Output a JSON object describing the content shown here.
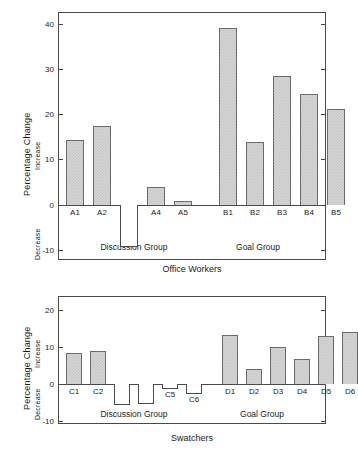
{
  "chart_data": [
    {
      "type": "bar",
      "title": "",
      "panel_label": "Office Workers",
      "xlabel": "Office Workers",
      "ylabel": "Percentage Change",
      "ylabel_upper": "Increase",
      "ylabel_lower": "Decrease",
      "ylim": [
        -10,
        43
      ],
      "yticks": [
        -10,
        0,
        10,
        20,
        30,
        40
      ],
      "ytick_labels": [
        "-10",
        "0",
        "10",
        "20",
        "30",
        "40"
      ],
      "grid": false,
      "legend": "none",
      "groups": [
        {
          "name": "Discussion Group",
          "categories": [
            "A1",
            "A2",
            "A3",
            "A4",
            "A5"
          ],
          "values": [
            14.2,
            17.3,
            -9.2,
            4.0,
            0.8
          ]
        },
        {
          "name": "Goal Group",
          "categories": [
            "B1",
            "B2",
            "B3",
            "B4",
            "B5"
          ],
          "values": [
            39.0,
            13.8,
            28.4,
            24.3,
            21.0
          ]
        }
      ],
      "categories": [
        "A1",
        "A2",
        "A3",
        "A4",
        "A5",
        "B1",
        "B2",
        "B3",
        "B4",
        "B5"
      ],
      "values": [
        14.2,
        17.3,
        -9.2,
        4.0,
        0.8,
        39.0,
        13.8,
        28.4,
        24.3,
        21.0
      ]
    },
    {
      "type": "bar",
      "title": "",
      "panel_label": "Swatchers",
      "xlabel": "Swatchers",
      "ylabel": "Percentage Change",
      "ylabel_upper": "Increase",
      "ylabel_lower": "Decrease",
      "ylim": [
        -12,
        23
      ],
      "yticks": [
        -10,
        0,
        10,
        20
      ],
      "ytick_labels": [
        "-10",
        "0",
        "10",
        "20"
      ],
      "grid": false,
      "legend": "none",
      "groups": [
        {
          "name": "Discussion Group",
          "categories": [
            "C1",
            "C2",
            "C3",
            "C4",
            "C5",
            "C6"
          ],
          "values": [
            8.3,
            8.8,
            -5.7,
            -5.3,
            -1.4,
            -2.8
          ]
        },
        {
          "name": "Goal Group",
          "categories": [
            "D1",
            "D2",
            "D3",
            "D4",
            "D5",
            "D6"
          ],
          "values": [
            13.2,
            4.1,
            10.0,
            6.7,
            13.0,
            14.0
          ]
        }
      ],
      "categories": [
        "C1",
        "C2",
        "C3",
        "C4",
        "C5",
        "C6",
        "D1",
        "D2",
        "D3",
        "D4",
        "D5",
        "D6"
      ],
      "values": [
        8.3,
        8.8,
        -5.7,
        -5.3,
        -1.4,
        -2.8,
        13.2,
        4.1,
        10.0,
        6.7,
        13.0,
        14.0
      ]
    }
  ],
  "colors": {
    "bar_fill": "#d6d6d6",
    "bar_hatch": "#c4c4c4",
    "bar_stroke": "#6b6b6b",
    "axis": "#4a4a4a",
    "text": "#1a1a1a",
    "background": "#ffffff"
  }
}
